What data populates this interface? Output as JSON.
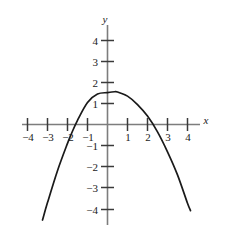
{
  "chart_data": {
    "type": "line",
    "title": "",
    "xlabel": "x",
    "ylabel": "y",
    "xlim": [
      -4.6,
      4.6
    ],
    "ylim": [
      -4.8,
      4.7
    ],
    "grid": false,
    "legend": null,
    "x_ticks": [
      -4,
      -3,
      -2,
      -1,
      1,
      2,
      3,
      4
    ],
    "y_ticks": [
      4,
      3,
      2,
      1,
      -1,
      -2,
      -3,
      -4
    ],
    "x_tick_labels": [
      "−4",
      "−3",
      "−2",
      "−1",
      "1",
      "2",
      "3",
      "4"
    ],
    "y_tick_labels": [
      "4",
      "3",
      "2",
      "1",
      "−1",
      "−2",
      "−3",
      "−4"
    ],
    "series": [
      {
        "name": "parabola",
        "description": "downward-opening parabola, vertex near (0.35, 1.55), roots near -1.8 and 2.5",
        "color": "#1a1a1a",
        "x": [
          -3.25,
          -3.0,
          -2.75,
          -2.5,
          -2.25,
          -2.0,
          -1.75,
          -1.5,
          -1.25,
          -1.0,
          -0.75,
          -0.5,
          -0.25,
          0.0,
          0.25,
          0.35,
          0.5,
          0.75,
          1.0,
          1.25,
          1.5,
          1.75,
          2.0,
          2.25,
          2.5,
          2.75,
          3.0,
          3.25,
          3.5,
          3.75,
          4.0,
          4.15
        ],
        "y": [
          -4.61,
          -3.73,
          -2.91,
          -2.14,
          -1.43,
          -0.77,
          -0.17,
          0.38,
          0.87,
          1.31,
          1.69,
          2.02,
          2.3,
          2.52,
          2.69,
          2.74,
          2.8,
          2.86,
          2.86,
          2.81,
          2.7,
          2.54,
          2.32,
          2.05,
          1.72,
          1.34,
          0.9,
          0.41,
          -0.14,
          -0.74,
          -1.4,
          -1.81
        ]
      }
    ],
    "curve_points": [
      {
        "x": -3.25,
        "y": -4.55
      },
      {
        "x": -3.0,
        "y": -3.72
      },
      {
        "x": -2.5,
        "y": -2.2
      },
      {
        "x": -2.0,
        "y": -0.9
      },
      {
        "x": -1.8,
        "y": -0.43
      },
      {
        "x": -1.5,
        "y": 0.2
      },
      {
        "x": -1.0,
        "y": 1.05
      },
      {
        "x": -0.5,
        "y": 1.45
      },
      {
        "x": 0.0,
        "y": 1.52
      },
      {
        "x": 0.35,
        "y": 1.56
      },
      {
        "x": 0.5,
        "y": 1.55
      },
      {
        "x": 1.0,
        "y": 1.35
      },
      {
        "x": 1.5,
        "y": 0.95
      },
      {
        "x": 2.0,
        "y": 0.4
      },
      {
        "x": 2.5,
        "y": -0.35
      },
      {
        "x": 3.0,
        "y": -1.3
      },
      {
        "x": 3.5,
        "y": -2.4
      },
      {
        "x": 4.0,
        "y": -3.75
      },
      {
        "x": 4.15,
        "y": -4.1
      }
    ],
    "vertex": {
      "x": 0.35,
      "y": 1.55
    },
    "roots": [
      -1.85,
      2.45
    ],
    "y_intercept": 1.5,
    "axis_color": "#808080",
    "curve_color": "#1a1a1a",
    "tick_color": "#4a4a4a",
    "background": "#ffffff"
  }
}
